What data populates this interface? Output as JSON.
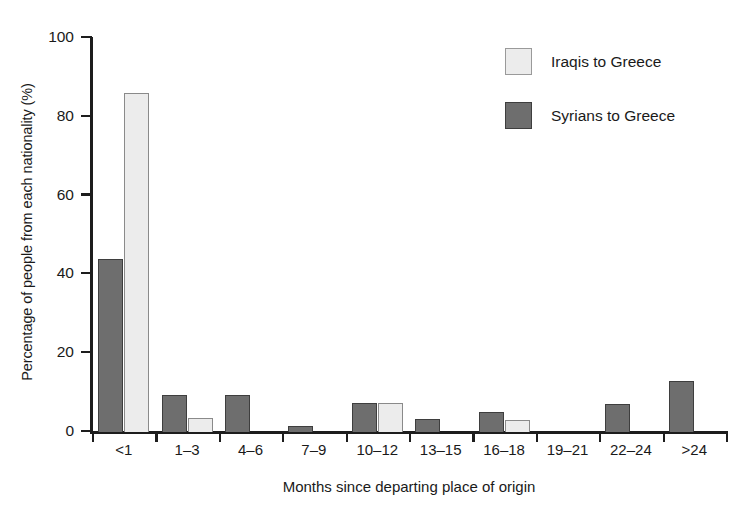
{
  "chart_data": {
    "type": "bar",
    "title": "",
    "xlabel": "Months since departing place of origin",
    "ylabel": "Percentage of people from each nationality (%)",
    "categories": [
      "<1",
      "1–3",
      "4–6",
      "7–9",
      "10–12",
      "13–15",
      "16–18",
      "19–21",
      "22–24",
      ">24"
    ],
    "series": [
      {
        "name": "Syrians to Greece",
        "color": "#6e6e6e",
        "values": [
          44,
          9.5,
          9.5,
          1.5,
          7.3,
          3.3,
          5,
          0,
          7,
          13
        ]
      },
      {
        "name": "Iraqis to Greece",
        "color": "#ececec",
        "values": [
          86,
          3.5,
          0,
          0,
          7.3,
          0,
          3,
          0,
          0,
          0
        ]
      }
    ],
    "series_draw_order": [
      "Syrians to Greece",
      "Iraqis to Greece"
    ],
    "ylim": [
      0,
      100
    ],
    "yticks": [
      0,
      20,
      40,
      60,
      80,
      100
    ],
    "ytick_labels": [
      "0",
      "20",
      "40",
      "60",
      "80",
      "100"
    ],
    "grid": false,
    "legend_position": "top-right",
    "legend_order": [
      "Iraqis to Greece",
      "Syrians to Greece"
    ]
  },
  "legend": {
    "entries": [
      {
        "label": "Iraqis to Greece",
        "color": "#ececec",
        "swatch": "light"
      },
      {
        "label": "Syrians to Greece",
        "color": "#6e6e6e",
        "swatch": "dark"
      }
    ]
  },
  "colors": {
    "dark_bar": "#6e6e6e",
    "light_bar": "#ececec",
    "axis": "#1d1d1d",
    "text": "#1a1a1a",
    "background": "#ffffff"
  }
}
